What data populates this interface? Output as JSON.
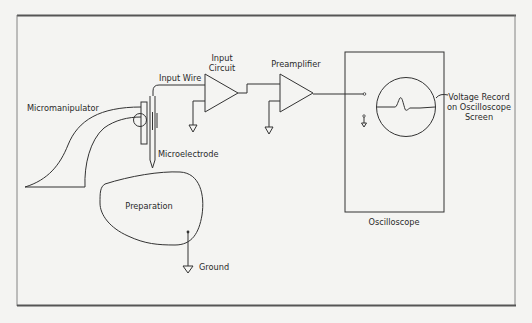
{
  "figure": {
    "type": "schematic",
    "colors": {
      "background": "#f4f4f2",
      "stroke": "#333333",
      "frame": "#555555"
    }
  },
  "labels": {
    "micromanipulator": "Micromanipulator",
    "microelectrode": "Microelectrode",
    "input_wire": "Input Wire",
    "input_circuit_line1": "Input",
    "input_circuit_line2": "Circuit",
    "preamplifier": "Preamplifier",
    "voltage_record_line1": "Voltage Record",
    "voltage_record_line2": "on Oscilloscope",
    "voltage_record_line3": "Screen",
    "oscilloscope": "Oscilloscope",
    "preparation": "Preparation",
    "ground": "Ground"
  },
  "components": [
    {
      "id": "micromanipulator",
      "label": "Micromanipulator"
    },
    {
      "id": "microelectrode",
      "label": "Microelectrode"
    },
    {
      "id": "input-circuit",
      "label": "Input Circuit",
      "symbol": "amplifier-triangle",
      "grounded": true
    },
    {
      "id": "preamplifier",
      "label": "Preamplifier",
      "symbol": "amplifier-triangle",
      "grounded": true
    },
    {
      "id": "oscilloscope",
      "label": "Oscilloscope",
      "screen_trace": "baseline with single spike then small undershoot"
    },
    {
      "id": "preparation",
      "label": "Preparation",
      "grounded": true
    }
  ],
  "connections": [
    {
      "from": "microelectrode",
      "to": "input-circuit",
      "label": "Input Wire"
    },
    {
      "from": "input-circuit",
      "to": "preamplifier"
    },
    {
      "from": "preamplifier",
      "to": "oscilloscope"
    },
    {
      "from": "preparation",
      "to": "ground",
      "label": "Ground"
    }
  ]
}
